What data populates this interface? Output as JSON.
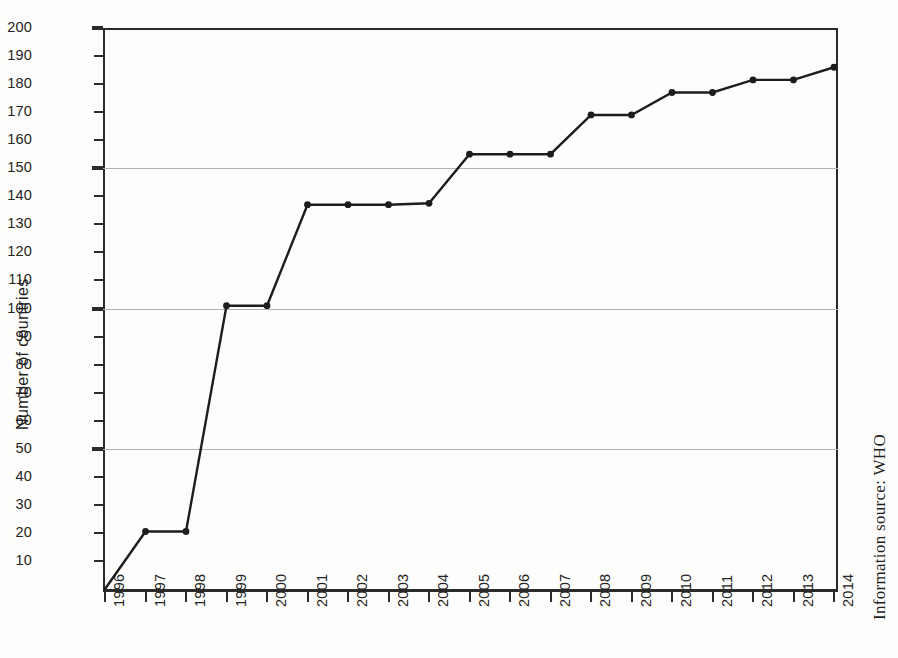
{
  "chart_data": {
    "type": "line",
    "title": "",
    "xlabel": "",
    "ylabel": "Number of countries",
    "categories": [
      "1996",
      "1997",
      "1998",
      "1999",
      "2000",
      "2001",
      "2002",
      "2003",
      "2004",
      "2005",
      "2006",
      "2007",
      "2008",
      "2009",
      "2010",
      "2011",
      "2012",
      "2013",
      "2014"
    ],
    "values": [
      0,
      20.5,
      20.5,
      101,
      101,
      137,
      137,
      137,
      137.5,
      155,
      155,
      155,
      169,
      169,
      177,
      177,
      181.5,
      181.5,
      186
    ],
    "series": [
      {
        "name": "Number of countries",
        "values": [
          0,
          20.5,
          20.5,
          101,
          101,
          137,
          137,
          137,
          137.5,
          155,
          155,
          155,
          169,
          169,
          177,
          177,
          181.5,
          181.5,
          186
        ]
      }
    ],
    "ylim": [
      0,
      200
    ],
    "ytick_labels": [
      "10",
      "20",
      "30",
      "40",
      "50",
      "60",
      "70",
      "80",
      "90",
      "100",
      "110",
      "120",
      "130",
      "140",
      "150",
      "160",
      "170",
      "180",
      "190",
      "200"
    ],
    "ytick_values": [
      10,
      20,
      30,
      40,
      50,
      60,
      70,
      80,
      90,
      100,
      110,
      120,
      130,
      140,
      150,
      160,
      170,
      180,
      190,
      200
    ],
    "ytick_major_values": [
      50,
      100,
      150,
      200
    ],
    "gridline_values": [
      50,
      100,
      150
    ],
    "grid": true,
    "legend": "none",
    "line_color": "#1d1d1d",
    "marker_color": "#1d1d1d",
    "grid_color": "#b3b3b3",
    "axis_color": "#2b2b2b",
    "background_color": "#fdfdfc"
  },
  "annotations": {
    "source_note": "Information source: WHO"
  }
}
